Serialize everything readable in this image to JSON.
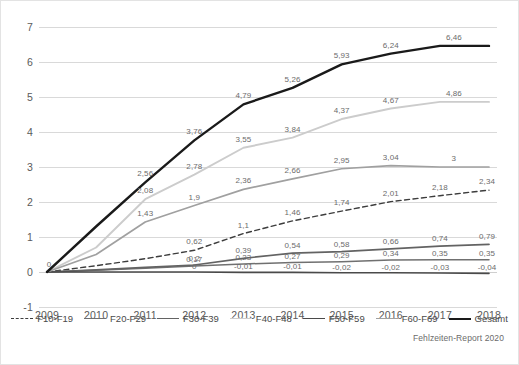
{
  "chart_data": {
    "type": "line",
    "title": "",
    "subtitle": "",
    "xlabel": "",
    "ylabel": "",
    "x": [
      2009,
      2010,
      2011,
      2012,
      2013,
      2014,
      2015,
      2016,
      2017,
      2018
    ],
    "xtick_labels": [
      "2009",
      "2010",
      "2011",
      "2012",
      "2013",
      "2014",
      "2015",
      "2016",
      "2017",
      "2018"
    ],
    "ylim": [
      -1,
      7
    ],
    "ytick_labels": [
      "-1",
      "0",
      "1",
      "2",
      "3",
      "4",
      "5",
      "6",
      "7"
    ],
    "yticks": [
      -1,
      0,
      1,
      2,
      3,
      4,
      5,
      6,
      7
    ],
    "grid": true,
    "legend_position": "bottom",
    "decimal_separator": ",",
    "source_note": "Fehlzeiten-Report 2020",
    "series": [
      {
        "name": "F10-F19",
        "color": "#3d3d3d",
        "style": "dashed",
        "width": 1.4,
        "values": [
          0,
          0.18,
          0.38,
          0.62,
          1.1,
          1.46,
          1.74,
          2.01,
          2.18,
          2.34
        ],
        "labels": [
          {
            "x": 2012,
            "value": "0,62",
            "dx": 0,
            "dy": -9
          },
          {
            "x": 2013,
            "value": "1,1",
            "dx": 0,
            "dy": -9
          },
          {
            "x": 2014,
            "value": "1,46",
            "dx": 0,
            "dy": -9
          },
          {
            "x": 2015,
            "value": "1,74",
            "dx": 0,
            "dy": -9
          },
          {
            "x": 2016,
            "value": "2,01",
            "dx": 0,
            "dy": -9
          },
          {
            "x": 2017,
            "value": "2,18",
            "dx": 0,
            "dy": -9
          },
          {
            "x": 2018,
            "value": "2,34",
            "dx": -2,
            "dy": -9
          }
        ]
      },
      {
        "name": "F20-F29",
        "color": "#707070",
        "style": "solid",
        "width": 1.5,
        "values": [
          0,
          0.05,
          0.11,
          0.17,
          0.23,
          0.27,
          0.29,
          0.34,
          0.35,
          0.35
        ],
        "labels": [
          {
            "x": 2012,
            "value": "0,17",
            "dx": 0,
            "dy": -7
          },
          {
            "x": 2013,
            "value": "0,23",
            "dx": 0,
            "dy": -7
          },
          {
            "x": 2014,
            "value": "0,27",
            "dx": 0,
            "dy": -7
          },
          {
            "x": 2015,
            "value": "0,29",
            "dx": 0,
            "dy": -7
          },
          {
            "x": 2016,
            "value": "0,34",
            "dx": 0,
            "dy": -7
          },
          {
            "x": 2017,
            "value": "0,35",
            "dx": 0,
            "dy": -7
          },
          {
            "x": 2018,
            "value": "0,35",
            "dx": -2,
            "dy": -7
          }
        ]
      },
      {
        "name": "F30-F39",
        "color": "#636363",
        "style": "solid",
        "width": 1.7,
        "values": [
          0,
          0.06,
          0.13,
          0.2,
          0.39,
          0.54,
          0.58,
          0.66,
          0.74,
          0.79
        ],
        "labels": [
          {
            "x": 2012,
            "value": "0,2",
            "dx": 0,
            "dy": -7
          },
          {
            "x": 2013,
            "value": "0,39",
            "dx": 0,
            "dy": -8
          },
          {
            "x": 2014,
            "value": "0,54",
            "dx": 0,
            "dy": -8
          },
          {
            "x": 2015,
            "value": "0,58",
            "dx": 0,
            "dy": -8
          },
          {
            "x": 2016,
            "value": "0,66",
            "dx": 0,
            "dy": -8
          },
          {
            "x": 2017,
            "value": "0,74",
            "dx": 0,
            "dy": -8
          },
          {
            "x": 2018,
            "value": "0,79",
            "dx": -2,
            "dy": -8
          }
        ]
      },
      {
        "name": "F40-F48",
        "color": "#cccccc",
        "style": "solid",
        "width": 1.9,
        "values": [
          0,
          0.7,
          2.08,
          2.78,
          3.55,
          3.84,
          4.37,
          4.67,
          4.86,
          4.86
        ],
        "labels": [
          {
            "x": 2011,
            "value": "2,08",
            "dx": 0,
            "dy": -9
          },
          {
            "x": 2012,
            "value": "2,78",
            "dx": 0,
            "dy": -9
          },
          {
            "x": 2013,
            "value": "3,55",
            "dx": 0,
            "dy": -9
          },
          {
            "x": 2014,
            "value": "3,84",
            "dx": 0,
            "dy": -9
          },
          {
            "x": 2015,
            "value": "4,37",
            "dx": 0,
            "dy": -9
          },
          {
            "x": 2016,
            "value": "4,67",
            "dx": 0,
            "dy": -9
          },
          {
            "x": 2017,
            "value": "4,86",
            "dx": 14,
            "dy": -9
          }
        ]
      },
      {
        "name": "F50-F59",
        "color": "#4a4a4a",
        "style": "solid",
        "width": 1.6,
        "values": [
          0,
          0,
          0,
          0,
          -0.01,
          -0.01,
          -0.02,
          -0.02,
          -0.03,
          -0.04
        ],
        "labels": [
          {
            "x": 2012,
            "value": "0",
            "dx": 0,
            "dy": -6
          },
          {
            "x": 2013,
            "value": "-0,01",
            "dx": 0,
            "dy": -6
          },
          {
            "x": 2014,
            "value": "-0,01",
            "dx": 0,
            "dy": -6
          },
          {
            "x": 2015,
            "value": "-0,02",
            "dx": 0,
            "dy": -6
          },
          {
            "x": 2016,
            "value": "-0,02",
            "dx": 0,
            "dy": -6
          },
          {
            "x": 2017,
            "value": "-0,03",
            "dx": 0,
            "dy": -6
          },
          {
            "x": 2018,
            "value": "-0,04",
            "dx": -2,
            "dy": -6
          }
        ]
      },
      {
        "name": "F60-F69",
        "color": "#a0a0a0",
        "style": "solid",
        "width": 1.7,
        "values": [
          0,
          0.5,
          1.43,
          1.9,
          2.36,
          2.66,
          2.95,
          3.04,
          3.0,
          3.0
        ],
        "labels": [
          {
            "x": 2011,
            "value": "1,43",
            "dx": 0,
            "dy": -9
          },
          {
            "x": 2012,
            "value": "1,9",
            "dx": 0,
            "dy": -9
          },
          {
            "x": 2013,
            "value": "2,36",
            "dx": 0,
            "dy": -9
          },
          {
            "x": 2014,
            "value": "2,66",
            "dx": 0,
            "dy": -9
          },
          {
            "x": 2015,
            "value": "2,95",
            "dx": 0,
            "dy": -9
          },
          {
            "x": 2016,
            "value": "3,04",
            "dx": 0,
            "dy": -9
          },
          {
            "x": 2017,
            "value": "3",
            "dx": 14,
            "dy": -9
          }
        ]
      },
      {
        "name": "Gesamt",
        "color": "#1a1a1a",
        "style": "solid",
        "width": 2.4,
        "values": [
          0,
          1.3,
          2.56,
          3.76,
          4.79,
          5.26,
          5.93,
          6.24,
          6.46,
          6.46
        ],
        "labels": [
          {
            "x": 2009,
            "value": "0",
            "dx": 2,
            "dy": -8
          },
          {
            "x": 2011,
            "value": "2,56",
            "dx": 0,
            "dy": -9
          },
          {
            "x": 2012,
            "value": "3,76",
            "dx": 0,
            "dy": -9
          },
          {
            "x": 2013,
            "value": "4,79",
            "dx": 0,
            "dy": -9
          },
          {
            "x": 2014,
            "value": "5,26",
            "dx": 0,
            "dy": -9
          },
          {
            "x": 2015,
            "value": "5,93",
            "dx": 0,
            "dy": -9
          },
          {
            "x": 2016,
            "value": "6,24",
            "dx": 0,
            "dy": -9
          },
          {
            "x": 2017,
            "value": "6,46",
            "dx": 14,
            "dy": -9
          }
        ]
      }
    ],
    "legend": [
      {
        "label": "F10-F19",
        "color": "#3d3d3d",
        "style": "dashed"
      },
      {
        "label": "F20-F29",
        "color": "#707070",
        "style": "solid"
      },
      {
        "label": "F30-F39",
        "color": "#636363",
        "style": "solid"
      },
      {
        "label": "F40-F48",
        "color": "#cccccc",
        "style": "solid"
      },
      {
        "label": "F50-F59",
        "color": "#4a4a4a",
        "style": "solid"
      },
      {
        "label": "F60-F69",
        "color": "#a0a0a0",
        "style": "solid"
      },
      {
        "label": "Gesamt",
        "color": "#1a1a1a",
        "style": "thick"
      }
    ]
  }
}
